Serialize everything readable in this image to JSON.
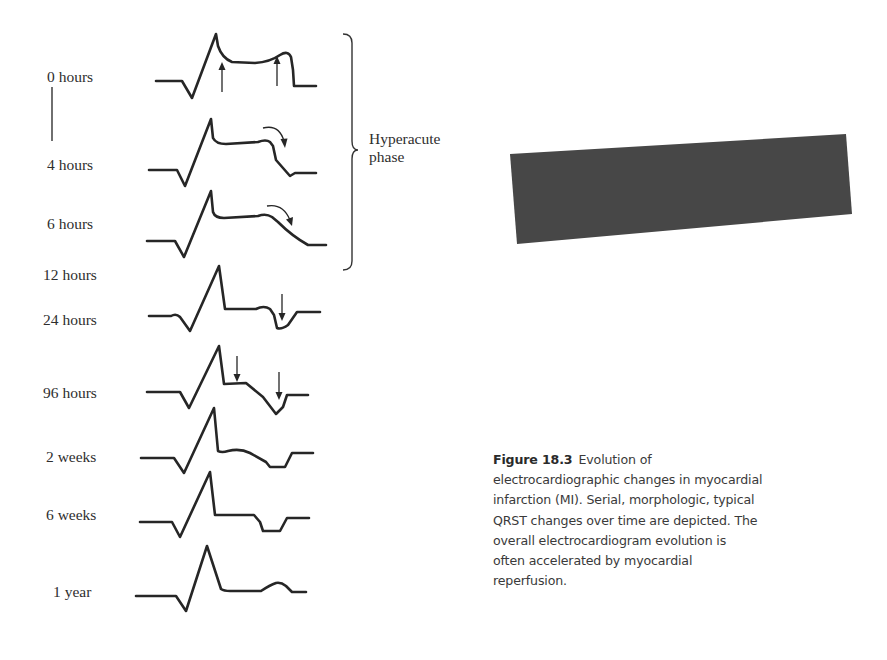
{
  "figure": {
    "number": "Figure 18.3",
    "caption_lines": [
      "Evolution of",
      "electrocardiographic changes in myocardial",
      "infarction (MI). Serial, morphologic, typical",
      "QRST changes over time are depicted. The",
      "overall electrocardiogram evolution is",
      "often accelerated by myocardial",
      "reperfusion."
    ],
    "caption_full": "Evolution of electrocardiographic changes in myocardial infarction (MI). Serial, morphologic, typical QRST changes over time are depicted. The overall electrocardiogram evolution is often accelerated by myocardial reperfusion."
  },
  "phase_bracket": {
    "label_line1": "Hyperacute",
    "label_line2": "phase",
    "spans": [
      "0 hours",
      "4 hours",
      "6 hours"
    ]
  },
  "time_labels": [
    {
      "id": "t0h",
      "text": "0 hours"
    },
    {
      "id": "t4h",
      "text": "4 hours"
    },
    {
      "id": "t6h",
      "text": "6 hours"
    },
    {
      "id": "t12h",
      "text": "12 hours"
    },
    {
      "id": "t24h",
      "text": "24 hours"
    },
    {
      "id": "t96h",
      "text": "96 hours"
    },
    {
      "id": "t2w",
      "text": "2 weeks"
    },
    {
      "id": "t6w",
      "text": "6 weeks"
    },
    {
      "id": "t1y",
      "text": "1 year"
    }
  ],
  "ecg_traces": [
    {
      "time": "0 hours",
      "feature": "Hyperacute peaked T wave with ST elevation",
      "arrows": [
        "up at ST onset",
        "up at T peak"
      ]
    },
    {
      "time": "4 hours",
      "feature": "ST elevation with T wave beginning to fall",
      "arrows": [
        "curved down at T wave"
      ]
    },
    {
      "time": "6 hours",
      "feature": "ST elevation, T wave descending",
      "arrows": [
        "curved down at T wave"
      ]
    },
    {
      "time": "12-24 hours",
      "feature": "Q wave with T wave inversion",
      "arrows": [
        "down at T wave inversion"
      ]
    },
    {
      "time": "96 hours",
      "feature": "ST segment returning toward baseline, deep T inversion",
      "arrows": [
        "down at ST segment",
        "down at inverted T"
      ]
    },
    {
      "time": "2 weeks",
      "feature": "Persisting T wave inversion"
    },
    {
      "time": "6 weeks",
      "feature": "Isoelectric ST with inverted T"
    },
    {
      "time": "1 year",
      "feature": "T wave normalized, upright"
    }
  ],
  "redaction": {
    "color": "#474747",
    "description": "dark rotated redaction block"
  },
  "colors": {
    "line": "#262626",
    "text": "#2e2e2e",
    "caption_text": "#3a3a3a",
    "background": "#ffffff"
  }
}
